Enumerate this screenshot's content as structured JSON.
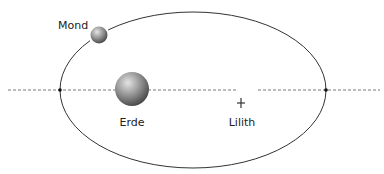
{
  "diagram": {
    "type": "orbit",
    "labels": {
      "moon": "Mond",
      "earth": "Erde",
      "lilith": "Lilith"
    },
    "orbit": {
      "shape": "ellipse",
      "stroke": "#333333"
    },
    "apsis_line": {
      "style": "dashed",
      "stroke": "#555555"
    },
    "colors": {
      "sphere_light": "#d8d8d8",
      "sphere_dark": "#4a4a4a",
      "crescent": "#333333"
    }
  }
}
